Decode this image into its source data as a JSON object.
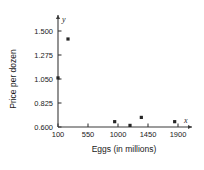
{
  "chart_data": {
    "type": "scatter",
    "title": "",
    "xlabel": "Eggs (in millions)",
    "ylabel": "Price per dozen",
    "x_axis_name": "x",
    "y_axis_name": "y",
    "xticks": [
      100,
      550,
      1000,
      1450,
      1900
    ],
    "xtick_labels": [
      "100",
      "550",
      "1000",
      "1450",
      "1900"
    ],
    "yticks": [
      0.6,
      0.825,
      1.05,
      1.275,
      1.5
    ],
    "ytick_labels": [
      "0.600",
      "0.825",
      "1.050",
      "1.275",
      "1.500"
    ],
    "xlim": [
      100,
      2000
    ],
    "ylim": [
      0.6,
      1.575
    ],
    "grid": false,
    "legend": false,
    "marker_color": "#262626",
    "axis_color": "#3a3a3a",
    "points": [
      {
        "x": 250,
        "y": 1.425
      },
      {
        "x": 100,
        "y": 1.06
      },
      {
        "x": 950,
        "y": 0.65
      },
      {
        "x": 1180,
        "y": 0.615
      },
      {
        "x": 1350,
        "y": 0.69
      },
      {
        "x": 1850,
        "y": 0.65
      }
    ]
  }
}
